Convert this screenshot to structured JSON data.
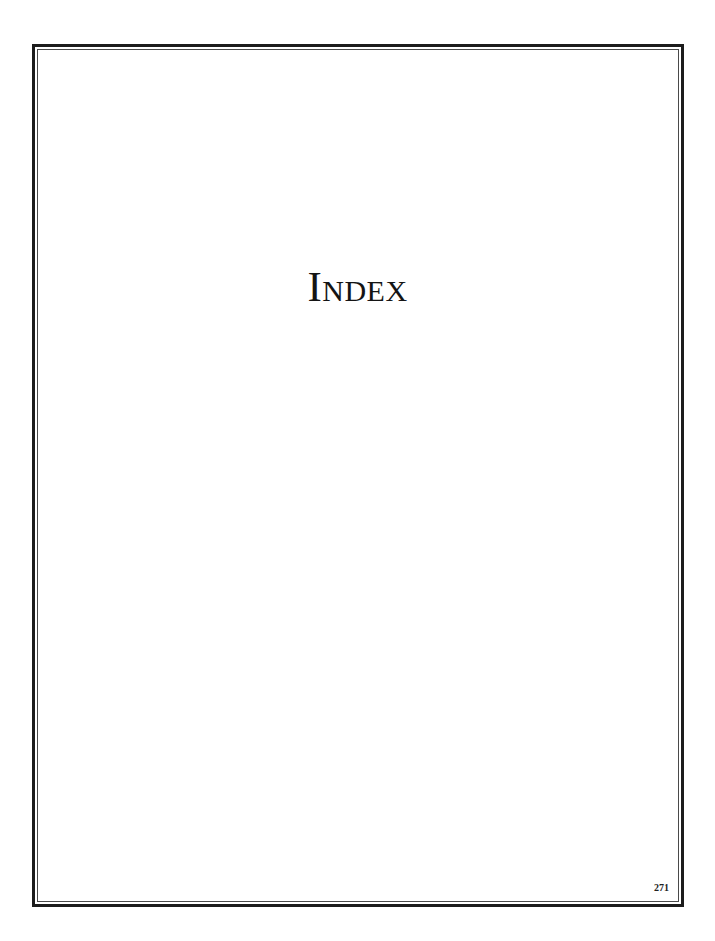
{
  "page": {
    "title": "Index",
    "page_number": "271"
  },
  "colors": {
    "border": "#1c1c1c",
    "text": "#141414",
    "background": "#ffffff"
  }
}
